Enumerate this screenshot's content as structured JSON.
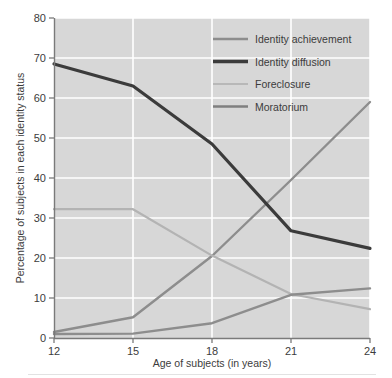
{
  "figure": {
    "background_color": "#ffffff",
    "plot_background_color": "#d7d7d7",
    "gridline_color": "#ffffff",
    "axis_color": "#808080",
    "text_color": "#3c3c3c"
  },
  "chart_data": {
    "type": "line",
    "title": "",
    "xlabel": "Age of subjects (in years)",
    "ylabel": "Percentage of subjects in each identity status",
    "x": [
      12,
      15,
      18,
      21,
      24
    ],
    "xlim": [
      12,
      24
    ],
    "ylim": [
      0,
      80
    ],
    "xticks": [
      12,
      15,
      18,
      21,
      24
    ],
    "yticks": [
      0,
      10,
      20,
      30,
      40,
      50,
      60,
      70,
      80
    ],
    "xtick_labels": [
      "12",
      "15",
      "18",
      "21",
      "24"
    ],
    "ytick_labels": [
      "0",
      "10",
      "20",
      "30",
      "40",
      "50",
      "60",
      "70",
      "80"
    ],
    "grid": true,
    "grid_axis": "both",
    "legend_position": "upper right",
    "series": [
      {
        "name": "Identity achievement",
        "values": [
          1.5,
          5.2,
          20.5,
          39.5,
          59.0
        ],
        "color": "#8d8d8d",
        "width": 2.4
      },
      {
        "name": "Identity diffusion",
        "values": [
          68.5,
          63.0,
          48.5,
          26.8,
          22.4
        ],
        "color": "#3b3b3b",
        "width": 3.2
      },
      {
        "name": "Foreclosure",
        "values": [
          32.2,
          32.2,
          20.6,
          11.0,
          7.2
        ],
        "color": "#b3b3b3",
        "width": 2.2
      },
      {
        "name": "Moratorium",
        "values": [
          1.0,
          1.1,
          3.7,
          10.8,
          12.4
        ],
        "color": "#8d8d8d",
        "width": 2.4
      }
    ]
  },
  "legend": {
    "items": [
      {
        "label": "Identity achievement",
        "color": "#8d8d8d",
        "width": 2.4
      },
      {
        "label": "Identity diffusion",
        "color": "#3b3b3b",
        "width": 3.4
      },
      {
        "label": "Foreclosure",
        "color": "#b8b8b8",
        "width": 1.8
      },
      {
        "label": "Moratorium",
        "color": "#7f7f7f",
        "width": 2.4
      }
    ]
  }
}
